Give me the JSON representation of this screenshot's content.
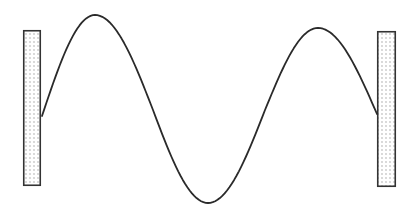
{
  "diagram": {
    "type": "standing-wave-between-walls",
    "background": "#ffffff",
    "stroke_color": "#2a2a2a",
    "wave": {
      "stroke_width": 1.8,
      "points": [
        [
          42,
          116
        ],
        [
          95,
          15
        ],
        [
          153,
          110
        ],
        [
          208,
          203
        ],
        [
          265,
          110
        ],
        [
          318,
          28
        ],
        [
          377,
          114
        ]
      ],
      "start": [
        42,
        116
      ],
      "peak_1": [
        95,
        15
      ],
      "trough": [
        208,
        203
      ],
      "peak_2": [
        318,
        28
      ],
      "end": [
        377,
        114
      ]
    },
    "walls": [
      {
        "name": "left-wall",
        "x": 23,
        "y": 30,
        "width": 18,
        "height": 156,
        "fill": "dotted"
      },
      {
        "name": "right-wall",
        "x": 377,
        "y": 31,
        "width": 19,
        "height": 156,
        "fill": "dotted"
      }
    ],
    "wall_fill_color": "#ffffff",
    "wall_dot_color": "#9a9a9a",
    "wall_border_color": "#333333"
  }
}
